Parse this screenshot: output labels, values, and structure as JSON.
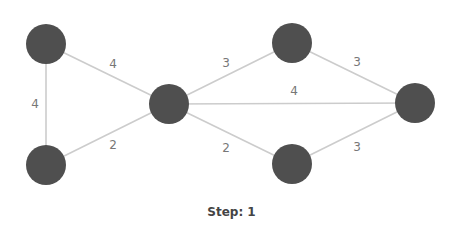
{
  "graph": {
    "nodes": [
      {
        "id": "A",
        "x": 46,
        "y": 44
      },
      {
        "id": "B",
        "x": 46,
        "y": 165
      },
      {
        "id": "C",
        "x": 169,
        "y": 104
      },
      {
        "id": "D",
        "x": 292,
        "y": 43
      },
      {
        "id": "E",
        "x": 292,
        "y": 164
      },
      {
        "id": "F",
        "x": 415,
        "y": 103
      }
    ],
    "edges": [
      {
        "from": "A",
        "to": "C",
        "weight": "4",
        "label_x": 113,
        "label_y": 64
      },
      {
        "from": "A",
        "to": "B",
        "weight": "4",
        "label_x": 35,
        "label_y": 104
      },
      {
        "from": "B",
        "to": "C",
        "weight": "2",
        "label_x": 113,
        "label_y": 145
      },
      {
        "from": "C",
        "to": "D",
        "weight": "3",
        "label_x": 226,
        "label_y": 63
      },
      {
        "from": "C",
        "to": "F",
        "weight": "4",
        "label_x": 294,
        "label_y": 91
      },
      {
        "from": "C",
        "to": "E",
        "weight": "2",
        "label_x": 226,
        "label_y": 148
      },
      {
        "from": "D",
        "to": "F",
        "weight": "3",
        "label_x": 357,
        "label_y": 62
      },
      {
        "from": "E",
        "to": "F",
        "weight": "3",
        "label_x": 357,
        "label_y": 147
      }
    ],
    "node_radius": 20,
    "colors": {
      "node": "#4f4f4f",
      "edge": "#cccccc",
      "label": "#777777"
    }
  },
  "status": {
    "step_text": "Step: 1"
  }
}
